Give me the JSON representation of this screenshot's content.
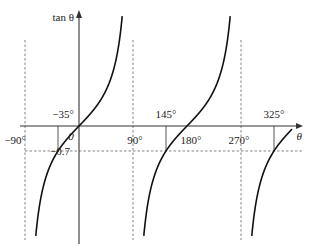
{
  "chart_data": {
    "type": "line",
    "title": "",
    "function": "tan θ",
    "xlabel": "θ",
    "ylabel": "tan θ",
    "x_unit": "degrees",
    "xlim": [
      -90,
      360
    ],
    "ylim": [
      -3.1,
      3.1
    ],
    "grid": false,
    "asymptotes_deg": [
      -90,
      90,
      270
    ],
    "x_tick_labels": [
      {
        "value": -90,
        "label": "−90°"
      },
      {
        "value": 90,
        "label": "90°"
      },
      {
        "value": 180,
        "label": "180°"
      },
      {
        "value": 270,
        "label": "270°"
      }
    ],
    "origin_label": "0",
    "horizontal_reference": {
      "value": -0.7,
      "label": "−0.7"
    },
    "solutions": [
      {
        "value": -35,
        "label": "−35°"
      },
      {
        "value": 145,
        "label": "145°"
      },
      {
        "value": 325,
        "label": "325°"
      }
    ],
    "series": [
      {
        "name": "tan θ branch 1",
        "x_range": [
          -88,
          88
        ]
      },
      {
        "name": "tan θ branch 2",
        "x_range": [
          92,
          268
        ]
      },
      {
        "name": "tan θ branch 3",
        "x_range": [
          272,
          355
        ]
      }
    ]
  }
}
